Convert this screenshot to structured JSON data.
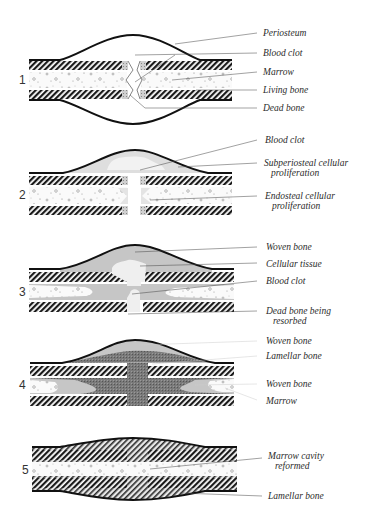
{
  "figure": {
    "colors": {
      "ink": "#1a1a1a",
      "callus_light": "#d9d9d9",
      "callus_mid": "#bdbdbd",
      "callus_dark": "#6e6e6e",
      "marrow": "#f6f6f6",
      "paper": "#ffffff"
    }
  },
  "stages": [
    {
      "number": "1",
      "labels": [
        {
          "text": "Periosteum"
        },
        {
          "text": "Blood clot"
        },
        {
          "text": "Marrow"
        },
        {
          "text": "Living bone"
        },
        {
          "text": "Dead bone"
        }
      ]
    },
    {
      "number": "2",
      "labels": [
        {
          "text": "Blood clot"
        },
        {
          "text": "Subperiosteal cellular",
          "text2": "proliferation"
        },
        {
          "text": "Endosteal cellular",
          "text2": "proliferation"
        }
      ]
    },
    {
      "number": "3",
      "labels": [
        {
          "text": "Woven bone"
        },
        {
          "text": "Cellular tissue"
        },
        {
          "text": "Blood clot"
        },
        {
          "text": "Dead bone being",
          "text2": "resorbed"
        }
      ]
    },
    {
      "number": "4",
      "labels": [
        {
          "text": "Woven bone"
        },
        {
          "text": "Lamellar bone"
        },
        {
          "text": "Woven bone"
        },
        {
          "text": "Marrow"
        }
      ]
    },
    {
      "number": "5",
      "labels": [
        {
          "text": "Marrow cavity",
          "text2": "reformed"
        },
        {
          "text": "Lamellar bone"
        }
      ]
    }
  ]
}
